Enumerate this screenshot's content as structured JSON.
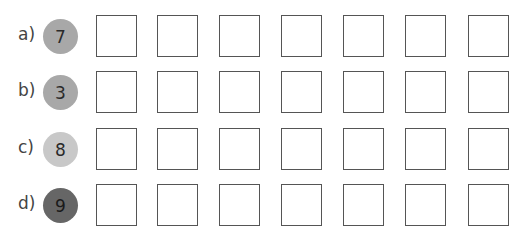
{
  "exercise": {
    "rows": [
      {
        "label": "a)",
        "number": "7",
        "circle_color": "#a8a8a8",
        "text_color": "#2a2a2a",
        "boxes": 7
      },
      {
        "label": "b)",
        "number": "3",
        "circle_color": "#a8a8a8",
        "text_color": "#2a2a2a",
        "boxes": 7
      },
      {
        "label": "c)",
        "number": "8",
        "circle_color": "#c8c8c8",
        "text_color": "#2a2a2a",
        "boxes": 7
      },
      {
        "label": "d)",
        "number": "9",
        "circle_color": "#666666",
        "text_color": "#1a1a1a",
        "boxes": 7
      }
    ],
    "answer_box_values": [
      [
        "",
        "",
        "",
        "",
        "",
        "",
        ""
      ],
      [
        "",
        "",
        "",
        "",
        "",
        "",
        ""
      ],
      [
        "",
        "",
        "",
        "",
        "",
        "",
        ""
      ],
      [
        "",
        "",
        "",
        "",
        "",
        "",
        ""
      ]
    ]
  }
}
